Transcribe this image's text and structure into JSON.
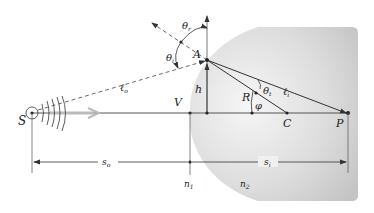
{
  "diagram": {
    "type": "refraction-at-spherical-surface",
    "colors": {
      "lens_fill_light": "#f4f4f4",
      "lens_fill_dark": "#c9c9c9",
      "line": "#333333",
      "dashed": "#444444",
      "axis_arrow": "#b5b5b5"
    },
    "labels": {
      "source": "S",
      "vertex": "V",
      "point_A": "A",
      "height": "h",
      "radius": "R",
      "center": "C",
      "image": "P",
      "angle_phi": "φ",
      "theta_r": "θ",
      "theta_r_sub": "r",
      "theta_i": "θ",
      "theta_i_sub": "i",
      "theta_t": "θ",
      "theta_t_sub": "t",
      "l_o": "ℓ",
      "l_o_sub": "o",
      "l_i": "ℓ",
      "l_i_sub": "i",
      "s_o": "s",
      "s_o_sub": "o",
      "s_i": "s",
      "s_i_sub": "i",
      "n1": "n",
      "n1_sub": "1",
      "n2": "n",
      "n2_sub": "2"
    }
  }
}
